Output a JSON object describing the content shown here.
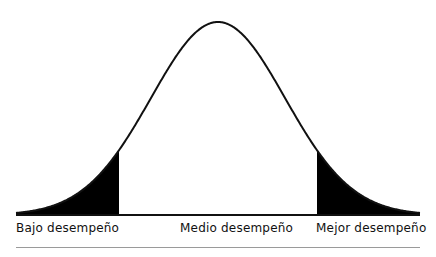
{
  "diagram": {
    "type": "normal-distribution-curve",
    "center_x": 218,
    "baseline_y": 215,
    "peak_y": 22,
    "sigma_px": 67,
    "x_start": 16,
    "x_end": 420,
    "left_tail_cut_x": 119,
    "right_tail_cut_x": 317,
    "line_color": "#111111",
    "fill_color": "#000000"
  },
  "labels": {
    "low": "Bajo desempeño",
    "mid": "Medio desempeño",
    "high": "Mejor desempeño"
  }
}
